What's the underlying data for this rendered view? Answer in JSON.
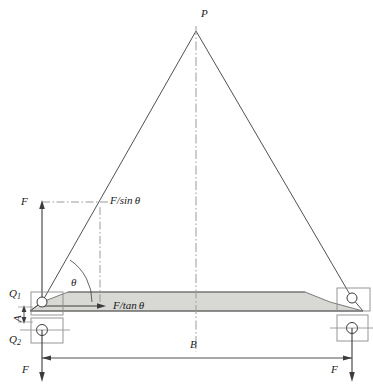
{
  "diagram": {
    "colors": {
      "line": "#3c3c3c",
      "beam_fill": "#d8d8d4",
      "beam_stroke": "#6e6e6e",
      "centerline": "#9a9a9a",
      "text": "#1a1a1a"
    },
    "labels": {
      "apex": "P",
      "force_left_top": "F",
      "force_bottom_left": "F",
      "force_bottom_right": "F",
      "sling_tension": "F/sin",
      "sling_tension_sym": "θ",
      "horizontal_thrust": "F/tan",
      "horizontal_thrust_sym": "θ",
      "angle": "θ",
      "reaction_upper": "Q",
      "reaction_upper_sub": "1",
      "reaction_lower": "Q",
      "reaction_lower_sub": "2",
      "span": "B",
      "height_dim": "A"
    },
    "geometry": {
      "apex": {
        "x": 196,
        "y": 31
      },
      "left_pin": {
        "x": 42,
        "y": 302
      },
      "right_pin": {
        "x": 352,
        "y": 298
      },
      "beam_top_y": 292,
      "beam_bottom_y": 311,
      "span_dim_y": 358,
      "angle_deg": 55
    }
  }
}
